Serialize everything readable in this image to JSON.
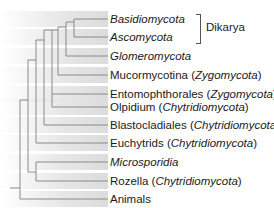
{
  "diagram": {
    "type": "phylogenetic-tree",
    "taxa": [
      {
        "id": "basidiomycota",
        "y": 19,
        "parts": [
          {
            "t": "Basidiomycota",
            "i": true
          }
        ]
      },
      {
        "id": "ascomycota",
        "y": 37,
        "parts": [
          {
            "t": "Ascomycota",
            "i": true
          }
        ]
      },
      {
        "id": "glomeromycota",
        "y": 56,
        "parts": [
          {
            "t": "Glomeromycota",
            "i": true
          }
        ]
      },
      {
        "id": "mucormycotina",
        "y": 75,
        "parts": [
          {
            "t": "Mucormycotina (",
            "i": false
          },
          {
            "t": "Zygomycota",
            "i": true
          },
          {
            "t": ")",
            "i": false
          }
        ]
      },
      {
        "id": "entomophthorales",
        "y": 94,
        "parts": [
          {
            "t": "Entomophthorales (",
            "i": false
          },
          {
            "t": "Zygomycota",
            "i": true
          },
          {
            "t": ")",
            "i": false
          }
        ]
      },
      {
        "id": "olpidium",
        "y": 107,
        "parts": [
          {
            "t": "Olpidium (",
            "i": false
          },
          {
            "t": "Chytridiomycota",
            "i": true
          },
          {
            "t": ")",
            "i": false
          }
        ]
      },
      {
        "id": "blastocladiales",
        "y": 125,
        "parts": [
          {
            "t": "Blastocladiales (",
            "i": false
          },
          {
            "t": "Chytridiomycota",
            "i": true
          },
          {
            "t": ")",
            "i": false
          }
        ]
      },
      {
        "id": "euchytrids",
        "y": 143,
        "parts": [
          {
            "t": "Euchytrids (",
            "i": false
          },
          {
            "t": "Chytridiomycota",
            "i": true
          },
          {
            "t": ")",
            "i": false
          }
        ]
      },
      {
        "id": "microsporidia",
        "y": 162,
        "parts": [
          {
            "t": "Microsporidia",
            "i": true
          }
        ]
      },
      {
        "id": "rozella",
        "y": 181,
        "parts": [
          {
            "t": "Rozella (",
            "i": false
          },
          {
            "t": "Chytridiomycota",
            "i": true
          },
          {
            "t": ")",
            "i": false
          }
        ]
      },
      {
        "id": "animals",
        "y": 199,
        "parts": [
          {
            "t": "Animals",
            "i": false
          }
        ]
      }
    ],
    "group_bracket": {
      "label": "Dikarya",
      "spans": [
        "Basidiomycota",
        "Ascomycota"
      ]
    },
    "line_color": "#8a8a8a",
    "band_color": "#e3e3e3"
  }
}
